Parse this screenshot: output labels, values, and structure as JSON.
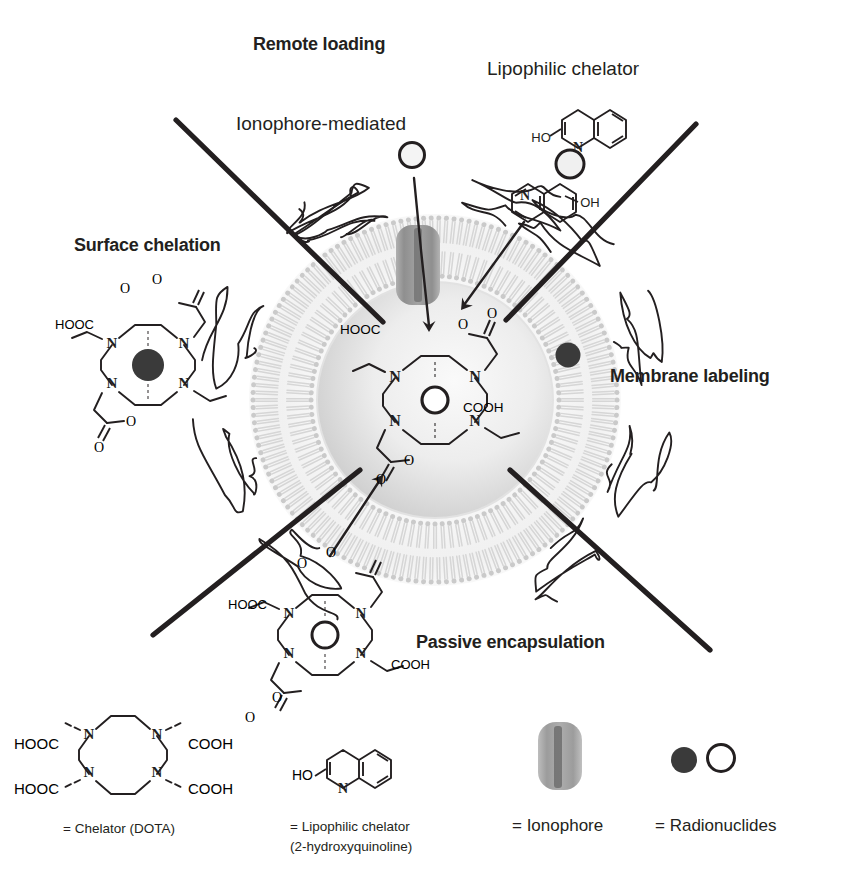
{
  "figure": {
    "background_color": "#ffffff",
    "ink_color": "#231f20"
  },
  "labels": {
    "remote_loading": "Remote loading",
    "ionophore_mediated": "Ionophore-mediated",
    "lipophilic_chelator": "Lipophilic chelator",
    "surface_chelation": "Surface chelation",
    "membrane_labeling": "Membrane labeling",
    "passive_encapsulation": "Passive encapsulation"
  },
  "chemistry": {
    "hooc": "HOOC",
    "cooh": "COOH",
    "o": "O",
    "n": "N",
    "ho": "HO",
    "oh": "OH"
  },
  "legend": {
    "items": [
      {
        "key": "chelator",
        "caption": "= Chelator (DOTA)",
        "caption_line2": "",
        "glyph": "dota-structure"
      },
      {
        "key": "lipophilic-chelator",
        "caption": "= Lipophilic chelator",
        "caption_line2": "(2-hydroxyquinoline)",
        "glyph": "quinoline-structure"
      },
      {
        "key": "ionophore",
        "caption": "= Ionophore",
        "caption_line2": "",
        "glyph": "ionophore-capsule"
      },
      {
        "key": "radionuclides",
        "caption": "= Radionuclides",
        "caption_line2": "",
        "glyph": "filled-and-open-circles"
      }
    ]
  },
  "colors": {
    "ink": "#231f20",
    "membrane_light": "#d8d8d8",
    "membrane_mid": "#c4c4c4",
    "lumen_light": "#f2f2f2",
    "lumen_mid": "#d9d9d9",
    "ionophore_gray": "#9a9a9a",
    "radionuclide_dark": "#3a3a3a",
    "radionuclide_open": "#ffffff"
  },
  "liposome": {
    "center_x": 435,
    "center_y": 400,
    "outer_radius": 182,
    "membrane_inner_radius": 124,
    "lumen_radius": 118
  }
}
